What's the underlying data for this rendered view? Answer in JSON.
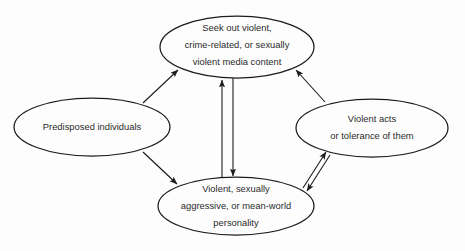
{
  "diagram": {
    "background_color": "#fdfdfd",
    "line_color": "#1b1b1b",
    "text_color": "#2b2b2b",
    "nodes": [
      {
        "id": "seek-media",
        "label_lines": [
          "Seek out violent,",
          "crime-related, or sexually",
          "violent media content"
        ]
      },
      {
        "id": "predisposed",
        "label_lines": [
          "Predisposed individuals"
        ]
      },
      {
        "id": "violent-acts",
        "label_lines": [
          "Violent acts",
          "or tolerance of them"
        ]
      },
      {
        "id": "personality",
        "label_lines": [
          "Violent, sexually",
          "aggressive, or mean-world",
          "personality"
        ]
      }
    ],
    "edges": [
      {
        "id": "predisposed-to-seek-media",
        "from": "predisposed",
        "to": "seek-media",
        "direction": "one-way"
      },
      {
        "id": "predisposed-to-personality",
        "from": "predisposed",
        "to": "personality",
        "direction": "one-way"
      },
      {
        "id": "personality-to-seek-media",
        "from": "personality",
        "to": "seek-media",
        "direction": "one-way"
      },
      {
        "id": "seek-media-to-personality",
        "from": "seek-media",
        "to": "personality",
        "direction": "one-way"
      },
      {
        "id": "violent-acts-to-seek-media",
        "from": "violent-acts",
        "to": "seek-media",
        "direction": "one-way"
      },
      {
        "id": "personality-to-violent-acts",
        "from": "personality",
        "to": "violent-acts",
        "direction": "one-way"
      },
      {
        "id": "violent-acts-to-personality",
        "from": "violent-acts",
        "to": "personality",
        "direction": "one-way"
      }
    ]
  }
}
